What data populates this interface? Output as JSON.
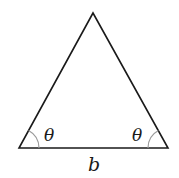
{
  "diagram": {
    "type": "isosceles-triangle",
    "vertices": {
      "apex": [
        93,
        13
      ],
      "base_left": [
        19,
        148
      ],
      "base_right": [
        168,
        148
      ]
    },
    "labels": {
      "left_angle": "θ",
      "right_angle": "θ",
      "base": "b"
    },
    "colors": {
      "stroke": "#1a1a1a",
      "arc": "#9a9a9a",
      "background": "#ffffff"
    }
  }
}
